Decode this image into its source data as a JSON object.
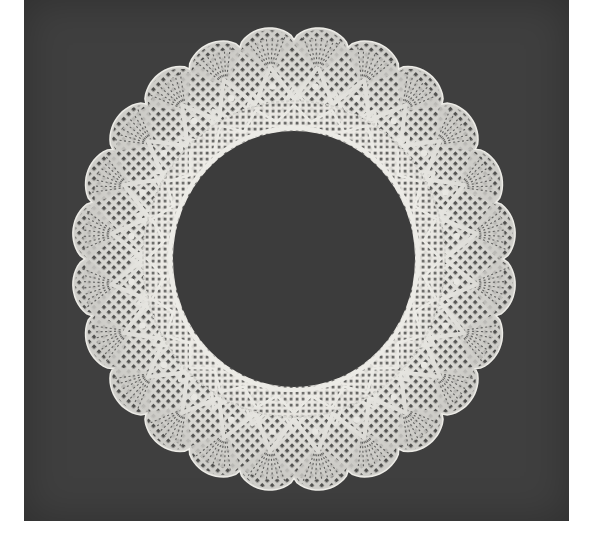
{
  "image": {
    "subject": "circular bobbin lace collar on dark background",
    "alt": "White scalloped lace collar with radiating fan motifs and zigzag bands, photographed on a dark grey background"
  },
  "colors": {
    "page_background": "#ffffff",
    "panel_background": "#3f3f3f",
    "lace": "#ecebe6",
    "lace_shadow": "#bdbcb6",
    "hole": "#3c3c3c"
  },
  "doily": {
    "center_x": 294,
    "center_y": 259,
    "outer_radius_x": 222,
    "outer_radius_y": 232,
    "inner_radius_x": 121,
    "inner_radius_y": 128,
    "scallop_count": 24
  }
}
